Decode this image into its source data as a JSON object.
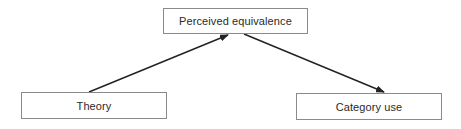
{
  "diagram": {
    "type": "flow",
    "nodes": [
      {
        "id": "perceived-equivalence",
        "label": "Perceived equivalence",
        "position": "top-center"
      },
      {
        "id": "theory",
        "label": "Theory",
        "position": "bottom-left"
      },
      {
        "id": "category-use",
        "label": "Category use",
        "position": "bottom-right"
      }
    ],
    "edges": [
      {
        "from": "theory",
        "to": "perceived-equivalence",
        "style": "arrow"
      },
      {
        "from": "perceived-equivalence",
        "to": "category-use",
        "style": "arrow"
      }
    ],
    "colors": {
      "box_border": "#8a8a8a",
      "arrow": "#222222",
      "text": "#2a2a2a",
      "background": "#ffffff"
    }
  }
}
